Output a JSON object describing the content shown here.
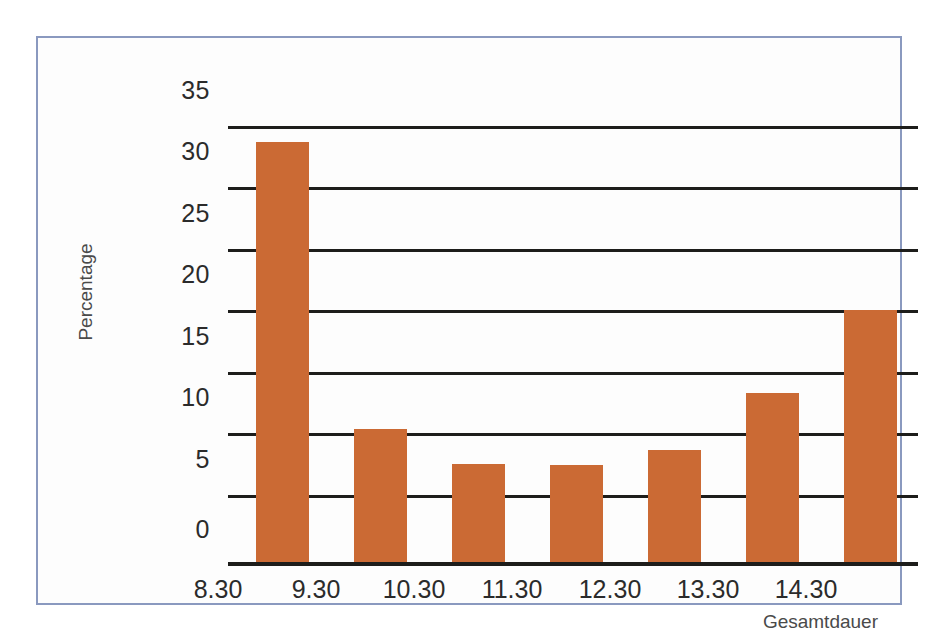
{
  "figure": {
    "background_color": "#ffffff",
    "frame_color": "#8a99bf",
    "plot_background": "#fdfdfd"
  },
  "chart_data": {
    "type": "bar",
    "title": "",
    "subtitle": "",
    "categories": [
      "8.30",
      "9.30",
      "10.30",
      "11.30",
      "12.30",
      "13.30",
      "14.30"
    ],
    "values": [
      33.7,
      10.7,
      7.9,
      7.8,
      9.0,
      13.6,
      20.2
    ],
    "series": [
      {
        "name": "Percentage",
        "values": [
          33.7,
          10.7,
          7.9,
          7.8,
          9.0,
          13.6,
          20.2
        ],
        "color": "#cb6a34"
      }
    ],
    "xlabel": "Gesamtdauer",
    "ylabel": "Percentage",
    "ylim": [
      0,
      35
    ],
    "xtick_labels": [
      "8.30",
      "9.30",
      "10.30",
      "11.30",
      "12.30",
      "13.30",
      "14.30"
    ],
    "ytick_labels": [
      "0",
      "5",
      "10",
      "15",
      "20",
      "25",
      "30",
      "35"
    ],
    "ytick_values": [
      0,
      5,
      10,
      15,
      20,
      25,
      30,
      35
    ],
    "grid": "horizontal",
    "legend": "none",
    "bar_color": "#cb6a34",
    "axis_color": "#1d1d1b"
  }
}
